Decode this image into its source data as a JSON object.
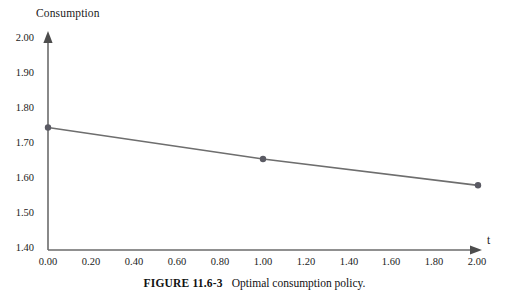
{
  "figure": {
    "caption_label": "FIGURE 11.6-3",
    "caption_text": "Optimal consumption policy."
  },
  "colors": {
    "background": "#ffffff",
    "axis": "#6b6b6b",
    "series_line": "#6e6e6e",
    "marker": "#5a5a63",
    "text": "#1a1a1a"
  },
  "chart_data": {
    "type": "line",
    "title": "",
    "xlabel": "t",
    "ylabel": "Consumption",
    "xlim": [
      0.0,
      2.0
    ],
    "ylim": [
      1.4,
      2.0
    ],
    "grid": false,
    "legend": false,
    "x_ticks": [
      "0.00",
      "0.20",
      "0.40",
      "0.60",
      "0.80",
      "1.00",
      "1.20",
      "1.40",
      "1.60",
      "1.80",
      "2.00"
    ],
    "x_tick_values": [
      0.0,
      0.2,
      0.4,
      0.6,
      0.8,
      1.0,
      1.2,
      1.4,
      1.6,
      1.8,
      2.0
    ],
    "y_ticks": [
      "1.40",
      "1.50",
      "1.60",
      "1.70",
      "1.80",
      "1.90",
      "2.00"
    ],
    "y_tick_values": [
      1.4,
      1.5,
      1.6,
      1.7,
      1.8,
      1.9,
      2.0
    ],
    "series": [
      {
        "name": "Optimal consumption",
        "x": [
          0.0,
          1.0,
          2.0
        ],
        "values": [
          1.75,
          1.66,
          1.585
        ],
        "markers": true
      }
    ]
  }
}
